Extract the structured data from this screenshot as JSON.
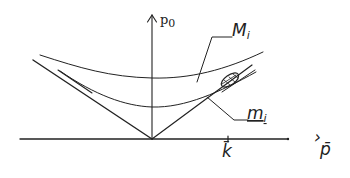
{
  "diagram": {
    "type": "dispersion-relation-sketch",
    "axes": {
      "vertical": {
        "label": "p",
        "subscript": "0"
      },
      "horizontal": {
        "label": "p̄",
        "prefix_mark": "›"
      }
    },
    "curves": [
      {
        "id": "upper",
        "label": "M",
        "subscript": "i"
      },
      {
        "id": "lower",
        "label": "m",
        "subscript": "i"
      }
    ],
    "markers": [
      {
        "id": "k-bar",
        "label": "k̄"
      }
    ],
    "features": [
      "light-cone-lines",
      "hatched-ellipse-region"
    ],
    "colors": {
      "ink": "#222222",
      "background": "#ffffff"
    }
  }
}
